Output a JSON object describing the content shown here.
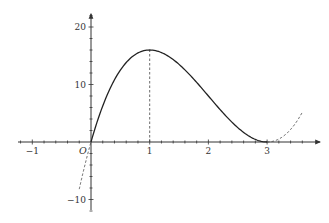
{
  "chart_data": {
    "type": "line",
    "title": "",
    "xlabel": "",
    "ylabel": "",
    "function": "f(x) = 4x(x-3)^2",
    "xlim": [
      -1.25,
      3.85
    ],
    "ylim": [
      -11.5,
      22
    ],
    "grid": false,
    "legend": null,
    "origin_label": "O",
    "x_ticks": [
      -1,
      1,
      2,
      3
    ],
    "x_tick_labels": [
      "−1",
      "1",
      "2",
      "3"
    ],
    "x_minor_step": 0.2,
    "y_ticks": [
      20,
      10,
      -10
    ],
    "y_tick_labels": [
      "20",
      "10",
      "−10"
    ],
    "y_minor_step": 2,
    "series": [
      {
        "name": "f(x) solid segment",
        "style": "solid",
        "x_range": [
          0,
          3
        ],
        "x": [
          0,
          0.25,
          0.5,
          0.75,
          1,
          1.25,
          1.5,
          1.75,
          2,
          2.25,
          2.5,
          2.75,
          3
        ],
        "y": [
          0,
          7.5625,
          12.5,
          15.1875,
          16,
          15.3125,
          13.5,
          10.9375,
          8,
          5.0625,
          2.5,
          0.6875,
          0
        ]
      },
      {
        "name": "f(x) dashed left extension",
        "style": "dashed",
        "x_range": [
          -0.2,
          0
        ],
        "x": [
          -0.2,
          -0.1,
          0
        ],
        "y": [
          -8.192,
          -3.844,
          0
        ]
      },
      {
        "name": "f(x) dashed right extension",
        "style": "dashed",
        "x_range": [
          3,
          3.6
        ],
        "x": [
          3,
          3.2,
          3.4,
          3.6
        ],
        "y": [
          0,
          0.512,
          2.176,
          5.184
        ]
      }
    ],
    "annotations": [
      {
        "type": "dashed-vertical-line",
        "x": 1,
        "from_y": 0,
        "to_y": 16,
        "note": "maximum at (1, 16)"
      },
      {
        "type": "tangent-point",
        "x": 3,
        "y": 0,
        "note": "double root, curve touches x-axis"
      }
    ],
    "colors": {
      "curve": "#222222",
      "axis": "#333333",
      "dashed": "#444444"
    }
  }
}
